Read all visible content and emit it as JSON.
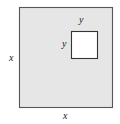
{
  "figure": {
    "kind": "geometry-diagram",
    "colors": {
      "outer_fill": "#e6e6e6",
      "outer_stroke": "#555555",
      "inner_fill": "#ffffff",
      "inner_stroke": "#333333",
      "label_color": "#1a1a1a",
      "background": "#ffffff"
    },
    "outer_square": {
      "name": "outer-square",
      "x": 19,
      "y": 7,
      "width": 94,
      "height": 101,
      "side_label": "x"
    },
    "inner_square": {
      "name": "inner-square",
      "x": 71,
      "y": 31,
      "width": 27,
      "height": 28,
      "side_label": "y"
    },
    "labels": {
      "x_left": "x",
      "x_bottom": "x",
      "y_top": "y",
      "y_left": "y"
    }
  }
}
